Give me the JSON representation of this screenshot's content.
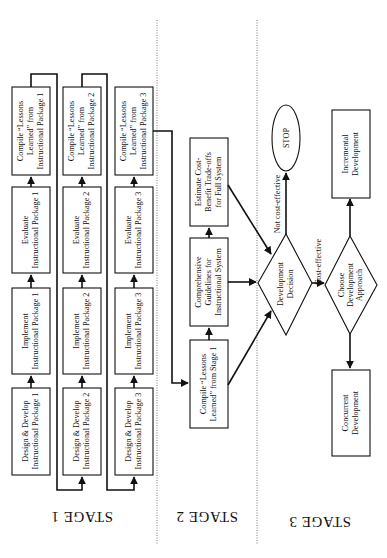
{
  "stages": {
    "stage1": {
      "label": "STAGE 1"
    },
    "stage2": {
      "label": "STAGE 2"
    },
    "stage3": {
      "label": "STAGE 3"
    }
  },
  "stage1": {
    "packages": [
      {
        "design": [
          "Design & Develop",
          "Instructional Package 1"
        ],
        "implement": [
          "Implement",
          "Instructional Package 1"
        ],
        "evaluate": [
          "Evaluate",
          "Instructional Package 1"
        ],
        "compile": [
          "Compile “Lessons",
          "Learned” from",
          "Instructional Package 1"
        ]
      },
      {
        "design": [
          "Design & Develop",
          "Instructional Package 2"
        ],
        "implement": [
          "Implement",
          "Instructional Package 2"
        ],
        "evaluate": [
          "Evaluate",
          "Instructional Package 2"
        ],
        "compile": [
          "Compile “Lessons",
          "Learned” from",
          "Instructional Package 2"
        ]
      },
      {
        "design": [
          "Design & Develop",
          "Instructional Package 3"
        ],
        "implement": [
          "Implement",
          "Instructional Package 3"
        ],
        "evaluate": [
          "Evaluate",
          "Instructional Package 3"
        ],
        "compile": [
          "Compile “Lessons",
          "Learned” from",
          "Instructional Package 3"
        ]
      }
    ]
  },
  "stage2": {
    "compile_stage1": [
      "Compile “Lessons",
      "Learned” from Stage 1"
    ],
    "guidelines": [
      "Comprehensive",
      "Guidelines for",
      "Instructional System"
    ],
    "estimate": [
      "Estimate Cost-",
      "Benefit Trade-offs",
      "for Full System"
    ]
  },
  "stage3": {
    "decision": [
      "Development",
      "Decision"
    ],
    "not_cost_effective": "Not cost-effective",
    "cost_effective": "Cost-effective",
    "stop": "STOP",
    "choose": [
      "Choose",
      "Development",
      "Approach"
    ],
    "incremental": [
      "Incremental",
      "Development"
    ],
    "concurrent": [
      "Concurrent",
      "Development"
    ]
  }
}
